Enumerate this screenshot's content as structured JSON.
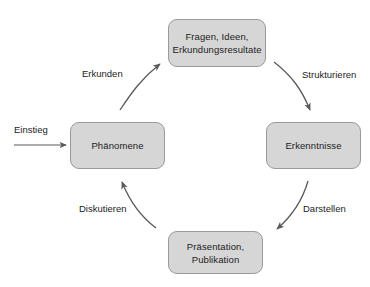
{
  "diagram": {
    "background_color": "#ffffff",
    "node_fill_color": "#d6d6d6",
    "node_border_color": "#9a9a9a",
    "text_color": "#1c1c1c",
    "arrow_color": "#59595b",
    "nodes": [
      {
        "id": "fragen",
        "label": "Fragen, Ideen,\nErkundungsresultate"
      },
      {
        "id": "erkenntnisse",
        "label": "Erkenntnisse"
      },
      {
        "id": "praesentation",
        "label": "Präsentation,\nPublikation"
      },
      {
        "id": "phaenomene",
        "label": "Phänomene"
      }
    ],
    "edges": [
      {
        "id": "erkunden",
        "label": "Erkunden",
        "from": "phaenomene",
        "to": "fragen"
      },
      {
        "id": "strukturieren",
        "label": "Strukturieren",
        "from": "fragen",
        "to": "erkenntnisse"
      },
      {
        "id": "darstellen",
        "label": "Darstellen",
        "from": "erkenntnisse",
        "to": "praesentation"
      },
      {
        "id": "diskutieren",
        "label": "Diskutieren",
        "from": "praesentation",
        "to": "phaenomene"
      },
      {
        "id": "einstieg",
        "label": "Einstieg",
        "from": "",
        "to": "phaenomene"
      }
    ]
  }
}
